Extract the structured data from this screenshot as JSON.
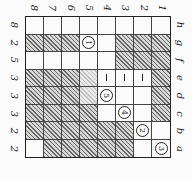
{
  "puzzle": {
    "orientation": "rotated-90",
    "column_labels": [
      "8",
      "7",
      "6",
      "5",
      "4",
      "3",
      "2",
      "1"
    ],
    "row_letters": [
      "h",
      "g",
      "f",
      "e",
      "d",
      "c",
      "b",
      "a"
    ],
    "row_clues": [
      "8",
      "2",
      "5",
      "3",
      "3",
      "3",
      "2",
      "2"
    ],
    "legend": {
      "#": "hatched cell",
      "L": "lightly hatched cell",
      ".": "white cell",
      "|": "bar mark",
      "1-9": "circled number"
    },
    "grid": [
      [
        ".",
        ".",
        ".",
        ".",
        ".",
        ".",
        ".",
        "."
      ],
      [
        "#",
        "#",
        "#",
        "1",
        ".",
        "#",
        "#",
        "#"
      ],
      [
        ".",
        ".",
        ".",
        ".",
        ".",
        "#",
        "#",
        "#"
      ],
      [
        "#",
        "#",
        "#",
        "L",
        "|",
        "|",
        "|",
        "#"
      ],
      [
        "#",
        "#",
        "#",
        "L",
        "5",
        ".",
        ".",
        "#"
      ],
      [
        "#",
        "#",
        "#",
        "#",
        ".",
        "4",
        ".",
        "#"
      ],
      [
        "#",
        "#",
        "#",
        "#",
        "#",
        "#",
        "2",
        "."
      ],
      [
        ".",
        "#",
        "#",
        "#",
        "#",
        "#",
        ".",
        "3"
      ]
    ]
  }
}
